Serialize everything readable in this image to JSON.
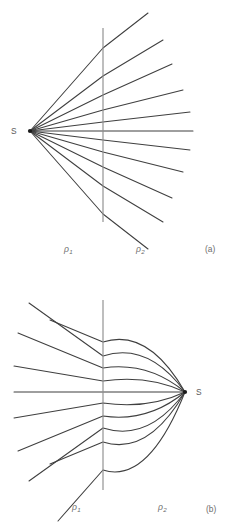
{
  "figure": {
    "width": 235,
    "height": 526,
    "background_color": "#ffffff",
    "ray_color": "#3f3f3f",
    "interface_color": "#8e8e8e",
    "label_color": "#6b6b6b",
    "source_color": "#1a1a1a"
  },
  "chart_data": {
    "type": "line",
    "xlabel": "",
    "ylabel": "",
    "xlim": [
      0,
      235
    ],
    "ylim": [
      0,
      526
    ],
    "grid": false,
    "legend_position": "none",
    "panels": [
      {
        "id": "a",
        "panel_label": "(a)",
        "panel_label_x": 205,
        "panel_label_y": 252,
        "description": "Point source S on the left in medium rho-1; rays diverge to the right and refract away from the normal on crossing the vertical interface into medium rho-2.",
        "source_label": "S",
        "source_label_x": 11,
        "source_label_y": 134,
        "source_x": 30,
        "source_y": 131,
        "interface": {
          "x": 103,
          "y_top": 28,
          "y_bottom": 222
        },
        "medium_labels": [
          {
            "base": "ρ",
            "sub": "1",
            "x": 64,
            "y": 252
          },
          {
            "base": "ρ",
            "sub": "2",
            "x": 136,
            "y": 252
          }
        ],
        "rays": [
          {
            "index": 1,
            "hit_x": 103,
            "hit_y": 48,
            "end_x": 148,
            "end_y": 13
          },
          {
            "index": 2,
            "hit_x": 103,
            "hit_y": 76,
            "end_x": 163,
            "end_y": 40
          },
          {
            "index": 3,
            "hit_x": 103,
            "hit_y": 95,
            "end_x": 172,
            "end_y": 64
          },
          {
            "index": 4,
            "hit_x": 103,
            "hit_y": 110,
            "end_x": 183,
            "end_y": 90
          },
          {
            "index": 5,
            "hit_x": 103,
            "hit_y": 122,
            "end_x": 190,
            "end_y": 112
          },
          {
            "index": 6,
            "hit_x": 103,
            "hit_y": 131,
            "end_x": 193,
            "end_y": 131
          },
          {
            "index": 7,
            "hit_x": 103,
            "hit_y": 140,
            "end_x": 190,
            "end_y": 150
          },
          {
            "index": 8,
            "hit_x": 103,
            "hit_y": 152,
            "end_x": 183,
            "end_y": 172
          },
          {
            "index": 9,
            "hit_x": 103,
            "hit_y": 167,
            "end_x": 172,
            "end_y": 198
          },
          {
            "index": 10,
            "hit_x": 103,
            "hit_y": 186,
            "end_x": 163,
            "end_y": 222
          },
          {
            "index": 11,
            "hit_x": 103,
            "hit_y": 214,
            "end_x": 148,
            "end_y": 249
          }
        ]
      },
      {
        "id": "b",
        "panel_label": "(b)",
        "panel_label_x": 206,
        "panel_label_y": 512,
        "description": "Rays converge from the left in medium rho-1, curve while crossing the vertical interface, and focus on point S at the right in medium rho-2.",
        "source_label": "S",
        "source_label_x": 196,
        "source_label_y": 395,
        "source_x": 185,
        "source_y": 392,
        "interface": {
          "x": 103,
          "y_top": 300,
          "y_bottom": 490
        },
        "medium_labels": [
          {
            "base": "ρ",
            "sub": "1",
            "x": 72,
            "y": 510
          },
          {
            "base": "ρ",
            "sub": "2",
            "x": 158,
            "y": 510
          }
        ],
        "rays": [
          {
            "index": 1,
            "start_x": 50,
            "start_y": 320,
            "hit_x": 103,
            "hit_y": 342,
            "curve": "outer"
          },
          {
            "index": 2,
            "start_x": 29,
            "start_y": 303,
            "hit_x": 103,
            "hit_y": 356,
            "curve": "outer"
          },
          {
            "index": 3,
            "start_x": 18,
            "start_y": 333,
            "hit_x": 103,
            "hit_y": 368,
            "curve": "mid"
          },
          {
            "index": 4,
            "start_x": 14,
            "start_y": 366,
            "hit_x": 103,
            "hit_y": 381,
            "curve": "mid"
          },
          {
            "index": 5,
            "start_x": 14,
            "start_y": 392,
            "hit_x": 103,
            "hit_y": 392,
            "curve": "none"
          },
          {
            "index": 6,
            "start_x": 14,
            "start_y": 418,
            "hit_x": 103,
            "hit_y": 403,
            "curve": "mid"
          },
          {
            "index": 7,
            "start_x": 18,
            "start_y": 451,
            "hit_x": 103,
            "hit_y": 416,
            "curve": "mid"
          },
          {
            "index": 8,
            "start_x": 29,
            "start_y": 481,
            "hit_x": 103,
            "hit_y": 428,
            "curve": "outer"
          },
          {
            "index": 9,
            "start_x": 50,
            "start_y": 464,
            "hit_x": 103,
            "hit_y": 442,
            "curve": "outer"
          },
          {
            "index": 10,
            "start_x": 58,
            "start_y": 521,
            "hit_x": 103,
            "hit_y": 470,
            "curve": "outer"
          }
        ]
      }
    ]
  }
}
